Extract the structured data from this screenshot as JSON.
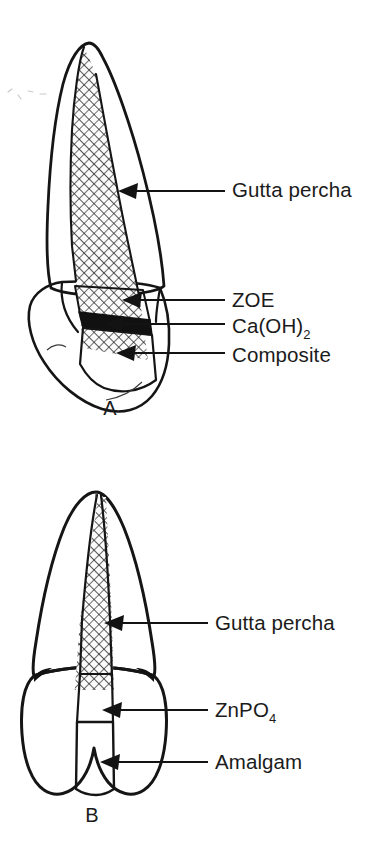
{
  "figure": {
    "background_color": "#ffffff",
    "ink_color": "#151515",
    "panels": [
      {
        "letter": "A",
        "tooth_type": "anterior incisor",
        "letter_x": 110,
        "letter_y": 415,
        "labels": [
          {
            "id": "gutta-percha-a",
            "text": "Gutta percha",
            "subscript": "",
            "text_x": 232,
            "text_y": 197,
            "arrow_tip_x": 118,
            "arrow_tip_y": 191,
            "leader_start_x": 225,
            "leader_y": 191
          },
          {
            "id": "zoe-a",
            "text": "ZOE",
            "subscript": "",
            "text_x": 232,
            "text_y": 307,
            "arrow_tip_x": 122,
            "arrow_tip_y": 300,
            "leader_start_x": 225,
            "leader_y": 300
          },
          {
            "id": "calcium-hydroxide-a",
            "text": "Ca(OH)",
            "subscript": "2",
            "text_x": 232,
            "text_y": 333,
            "arrow_tip_x": 104,
            "arrow_tip_y": 324,
            "leader_start_x": 225,
            "leader_y": 324
          },
          {
            "id": "composite-a",
            "text": "Composite",
            "subscript": "",
            "text_x": 232,
            "text_y": 362,
            "arrow_tip_x": 116,
            "arrow_tip_y": 353,
            "leader_start_x": 225,
            "leader_y": 353
          }
        ]
      },
      {
        "letter": "B",
        "tooth_type": "posterior premolar",
        "letter_x": 92,
        "letter_y": 822,
        "labels": [
          {
            "id": "gutta-percha-b",
            "text": "Gutta percha",
            "subscript": "",
            "text_x": 215,
            "text_y": 630,
            "arrow_tip_x": 104,
            "arrow_tip_y": 623,
            "leader_start_x": 208,
            "leader_y": 623
          },
          {
            "id": "zinc-phosphate-b",
            "text": "ZnPO",
            "subscript": "4",
            "text_x": 215,
            "text_y": 717,
            "arrow_tip_x": 102,
            "arrow_tip_y": 710,
            "leader_start_x": 208,
            "leader_y": 710
          },
          {
            "id": "amalgam-b",
            "text": "Amalgam",
            "subscript": "",
            "text_x": 215,
            "text_y": 769,
            "arrow_tip_x": 100,
            "arrow_tip_y": 762,
            "leader_start_x": 208,
            "leader_y": 762
          }
        ]
      }
    ],
    "materials": [
      {
        "name": "Gutta percha",
        "pattern": "cross-hatch diamond mesh",
        "color": "#f2f2f2"
      },
      {
        "name": "ZOE",
        "pattern": "diagonal hatch lines",
        "color": "#ededed"
      },
      {
        "name": "Ca(OH)2",
        "pattern": "solid black band",
        "color": "#111111"
      },
      {
        "name": "Composite",
        "pattern": "open circles",
        "color": "#ffffff"
      },
      {
        "name": "ZnPO4",
        "pattern": "diagonal hatch lines",
        "color": "#ededed"
      },
      {
        "name": "Amalgam",
        "pattern": "dense dot stipple",
        "color": "#ffffff"
      },
      {
        "name": "Crown dentin",
        "pattern": "light gray stipple",
        "color": "#d6d6d6"
      }
    ]
  }
}
